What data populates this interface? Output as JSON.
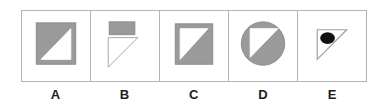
{
  "figure": {
    "kind": "multiple-choice-shape-options",
    "option_count": 5,
    "colors": {
      "gray_fill": "#9a9a9a",
      "shape_outline": "#8c8c8c",
      "dot_fill": "#111111",
      "cell_border": "#b4b4b4",
      "background": "#ffffff",
      "label_text": "#1c1c1c"
    }
  },
  "options": [
    {
      "label": "A",
      "name": "option-a",
      "description": "gray filled square containing a white right triangle with the right angle at the bottom right"
    },
    {
      "label": "B",
      "name": "option-b",
      "description": "gray filled rectangle above a white outlined right triangle with the right angle at the top left"
    },
    {
      "label": "C",
      "name": "option-c",
      "description": "gray filled square containing a white right triangle with the right angle at the top left"
    },
    {
      "label": "D",
      "name": "option-d",
      "description": "gray filled circle containing a white right triangle with the right angle at the top left"
    },
    {
      "label": "E",
      "name": "option-e",
      "description": "white outlined right triangle with the right angle at the top left containing a black filled dot"
    }
  ]
}
